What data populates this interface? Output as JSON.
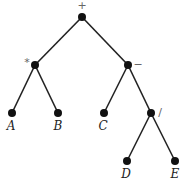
{
  "diagram": {
    "type": "expression-tree",
    "nodes": [
      {
        "id": "plus",
        "label": "+",
        "kind": "operator",
        "x": 82,
        "y": 17,
        "lx": 82,
        "ly": 9
      },
      {
        "id": "times",
        "label": "*",
        "kind": "operator",
        "x": 35,
        "y": 65,
        "lx": 27,
        "ly": 66
      },
      {
        "id": "minus",
        "label": "−",
        "kind": "operator",
        "x": 128,
        "y": 65,
        "lx": 138,
        "ly": 68
      },
      {
        "id": "A",
        "label": "A",
        "kind": "leaf",
        "x": 12,
        "y": 113,
        "lx": 11,
        "ly": 130
      },
      {
        "id": "B",
        "label": "B",
        "kind": "leaf",
        "x": 58,
        "y": 113,
        "lx": 58,
        "ly": 130
      },
      {
        "id": "C",
        "label": "C",
        "kind": "leaf",
        "x": 104,
        "y": 113,
        "lx": 103,
        "ly": 130
      },
      {
        "id": "divide",
        "label": "/",
        "kind": "operator",
        "x": 151,
        "y": 113,
        "lx": 160,
        "ly": 116
      },
      {
        "id": "D",
        "label": "D",
        "kind": "leaf",
        "x": 127,
        "y": 161,
        "lx": 126,
        "ly": 178
      },
      {
        "id": "E",
        "label": "E",
        "kind": "leaf",
        "x": 175,
        "y": 161,
        "lx": 175,
        "ly": 178
      }
    ],
    "edges": [
      [
        "plus",
        "times"
      ],
      [
        "plus",
        "minus"
      ],
      [
        "times",
        "A"
      ],
      [
        "times",
        "B"
      ],
      [
        "minus",
        "C"
      ],
      [
        "minus",
        "divide"
      ],
      [
        "divide",
        "D"
      ],
      [
        "divide",
        "E"
      ]
    ]
  }
}
